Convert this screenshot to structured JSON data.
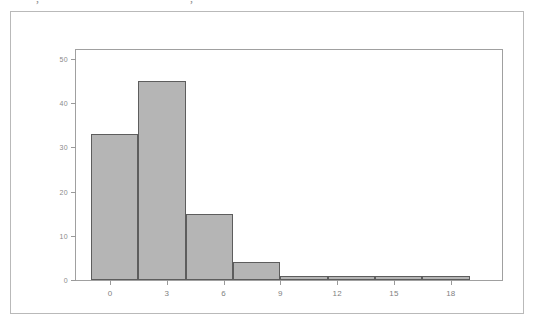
{
  "figure": {
    "background_color": "#ffffff",
    "frame_color": "#b9b9b9",
    "plot_border_color": "#a0a0a0"
  },
  "artifact": {
    "glyph_left": ",",
    "glyph_center": ","
  },
  "chart_data": {
    "type": "bar",
    "title": "",
    "xlabel": "Hours to Failure",
    "ylabel": "",
    "grid": false,
    "legend": "none",
    "bar_fill_color": "#b5b5b5",
    "bar_edge_color": "#5d5d5d",
    "xlim": [
      -1.8,
      20.7
    ],
    "ylim": [
      0,
      52
    ],
    "xticks": [
      0,
      3,
      6,
      9,
      12,
      15,
      18
    ],
    "xtick_labels": [
      "0",
      "3",
      "6",
      "9",
      "12",
      "15",
      "18"
    ],
    "yticks": [
      0,
      10,
      20,
      30,
      40,
      50
    ],
    "ytick_labels": [
      "0",
      "10",
      "20",
      "30",
      "40",
      "50"
    ],
    "bin_width": 2.5,
    "bin_edges": [
      -1.0,
      1.5,
      4.0,
      6.5,
      9.0,
      11.5,
      14.0,
      16.5,
      19.0
    ],
    "categories": [
      "-1.0 to 1.5",
      "1.5 to 4.0",
      "4.0 to 6.5",
      "6.5 to 9.0",
      "9.0 to 11.5",
      "11.5 to 14.0",
      "14.0 to 16.5",
      "16.5 to 19.0"
    ],
    "values": [
      33,
      45,
      15,
      4,
      1,
      1,
      1,
      1
    ]
  }
}
